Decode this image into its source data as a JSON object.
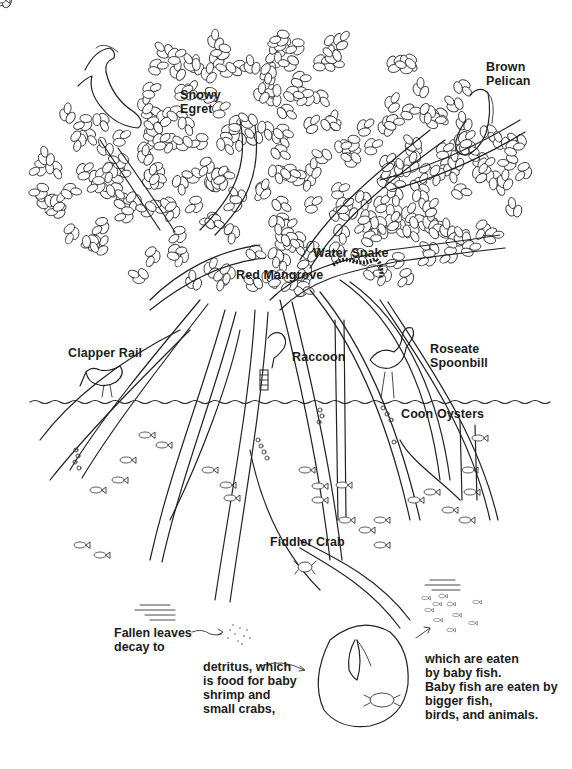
{
  "diagram": {
    "labels": {
      "snowy_egret": [
        "Snowy",
        "Egret"
      ],
      "brown_pelican": [
        "Brown",
        "Pelican"
      ],
      "water_snake": "Water Snake",
      "red_mangrove": "Red Mangrove",
      "clapper_rail": "Clapper Rail",
      "raccoon": "Raccoon",
      "roseate_spoonbill": [
        "Roseate",
        "Spoonbill"
      ],
      "coon_oysters": "Coon Oysters",
      "fiddler_crab": "Fiddler Crab"
    },
    "food_chain": {
      "step1": [
        "Fallen leaves",
        "decay to"
      ],
      "step2": [
        "detritus, which",
        "is food for baby",
        "shrimp and",
        "small crabs,"
      ],
      "step3": [
        "which are eaten",
        "by baby fish.",
        "Baby fish are eaten by",
        "bigger fish,",
        "birds, and animals."
      ]
    },
    "icons": [
      "egret-icon",
      "pelican-icon",
      "snake-icon",
      "raccoon-icon",
      "spoonbill-icon",
      "clapper-rail-icon",
      "oyster-cluster-icon",
      "fish-icon",
      "crab-icon",
      "shrimp-icon",
      "detritus-icon",
      "arrow-icon"
    ],
    "colors": {
      "ink": "#1c1c1c",
      "paper": "#ffffff"
    }
  }
}
